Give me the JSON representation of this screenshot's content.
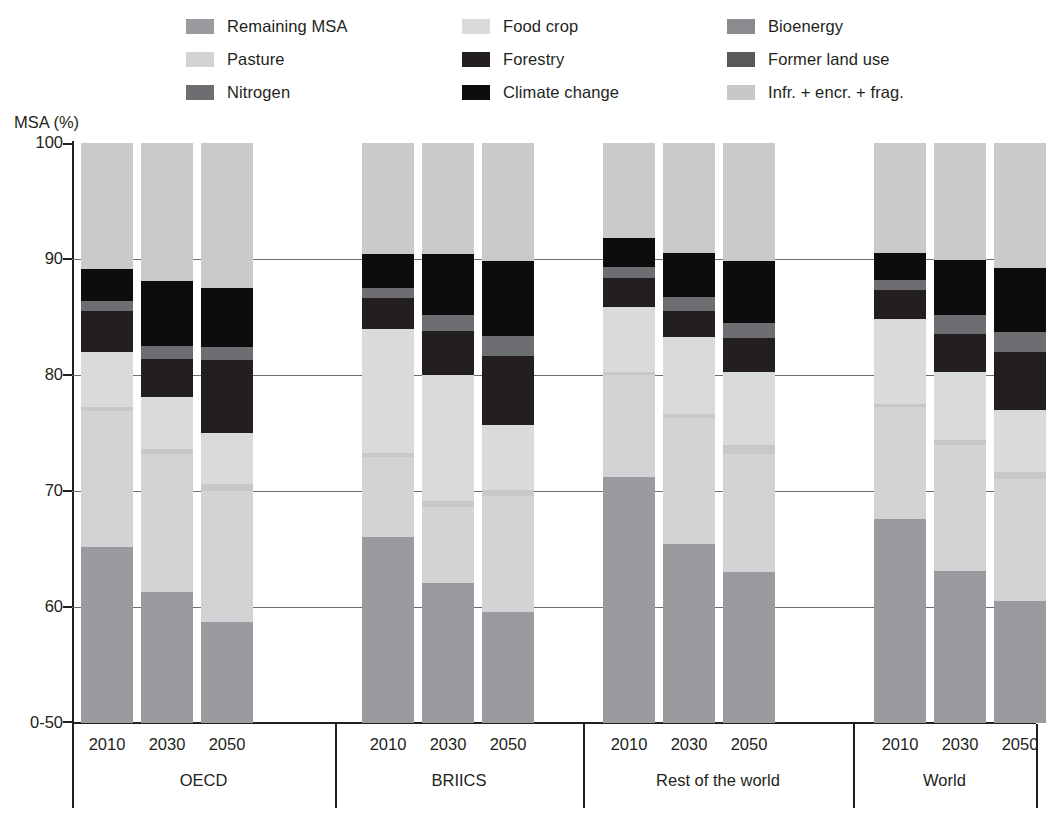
{
  "axis_title": "MSA (%)",
  "legend": {
    "columns": [
      [
        {
          "label": "Remaining MSA",
          "key": "remaining_msa",
          "color": "#9a9b9e"
        },
        {
          "label": "Pasture",
          "key": "pasture",
          "color": "#d2d3d4"
        },
        {
          "label": "Nitrogen",
          "key": "nitrogen",
          "color": "#6d6e71"
        }
      ],
      [
        {
          "label": "Food crop",
          "key": "food_crop",
          "color": "#d9dadb"
        },
        {
          "label": "Forestry",
          "key": "forestry",
          "color": "#231f20"
        },
        {
          "label": "Climate change",
          "key": "climate_change",
          "color": "#0d0d0d"
        }
      ],
      [
        {
          "label": "Bioenergy",
          "key": "bioenergy",
          "color": "#8b8c8f"
        },
        {
          "label": "Former land use",
          "key": "former_land_use",
          "color": "#58595b"
        },
        {
          "label": "Infr. + encr. + frag.",
          "key": "infr_encr_frag",
          "color": "#c7c8c9"
        }
      ]
    ]
  },
  "chart_data": {
    "type": "bar",
    "title": "",
    "xlabel": "",
    "ylabel": "MSA (%)",
    "stacked": true,
    "ylim": [
      50,
      100
    ],
    "ytick_labels": [
      "0-50",
      "60",
      "70",
      "80",
      "90",
      "100"
    ],
    "ytick_values": [
      50,
      60,
      70,
      80,
      90,
      100
    ],
    "grid": true,
    "legend_position": "top",
    "series_order": [
      "remaining_msa",
      "pasture",
      "infr_encr_frag",
      "food_crop",
      "bioenergy",
      "former_land_use",
      "forestry",
      "nitrogen",
      "climate_change"
    ],
    "groups": [
      {
        "name": "OECD",
        "years": [
          "2010",
          "2030",
          "2050"
        ],
        "bars": [
          {
            "year": "2010",
            "boundaries": [
              50.0,
              65.2,
              76.9,
              77.2,
              82.0,
              84.3,
              85.5,
              89.1,
              100.0
            ],
            "segments": [
              {
                "key": "remaining_msa",
                "from": 50.0,
                "to": 65.2
              },
              {
                "key": "pasture",
                "from": 65.2,
                "to": 76.9
              },
              {
                "key": "infr_encr_frag",
                "from": 76.9,
                "to": 77.2
              },
              {
                "key": "food_crop",
                "from": 77.2,
                "to": 82.0
              },
              {
                "key": "forestry",
                "from": 82.0,
                "to": 85.5
              },
              {
                "key": "nitrogen",
                "from": 85.5,
                "to": 86.4
              },
              {
                "key": "climate_change",
                "from": 86.4,
                "to": 89.1
              },
              {
                "key": "pasture_top",
                "from": 89.1,
                "to": 100.0
              }
            ]
          },
          {
            "year": "2030",
            "boundaries": [
              50.0,
              61.3,
              73.2,
              73.6,
              78.1,
              81.4,
              82.5,
              88.1,
              100.0
            ],
            "segments": [
              {
                "key": "remaining_msa",
                "from": 50.0,
                "to": 61.3
              },
              {
                "key": "pasture",
                "from": 61.3,
                "to": 73.2
              },
              {
                "key": "infr_encr_frag",
                "from": 73.2,
                "to": 73.6
              },
              {
                "key": "food_crop",
                "from": 73.6,
                "to": 78.1
              },
              {
                "key": "forestry",
                "from": 78.1,
                "to": 81.4
              },
              {
                "key": "nitrogen",
                "from": 81.4,
                "to": 82.5
              },
              {
                "key": "climate_change",
                "from": 82.5,
                "to": 88.1
              },
              {
                "key": "pasture_top",
                "from": 88.1,
                "to": 100.0
              }
            ]
          },
          {
            "year": "2050",
            "boundaries": [
              50.0,
              58.7,
              70.0,
              70.6,
              75.0,
              81.3,
              82.4,
              87.5,
              100.0
            ],
            "segments": [
              {
                "key": "remaining_msa",
                "from": 50.0,
                "to": 58.7
              },
              {
                "key": "pasture",
                "from": 58.7,
                "to": 70.0
              },
              {
                "key": "infr_encr_frag",
                "from": 70.0,
                "to": 70.6
              },
              {
                "key": "food_crop",
                "from": 70.6,
                "to": 75.0
              },
              {
                "key": "forestry",
                "from": 75.0,
                "to": 81.3
              },
              {
                "key": "nitrogen",
                "from": 81.3,
                "to": 82.4
              },
              {
                "key": "climate_change",
                "from": 82.4,
                "to": 87.5
              },
              {
                "key": "pasture_top",
                "from": 87.5,
                "to": 100.0
              }
            ]
          }
        ]
      },
      {
        "name": "BRIICS",
        "years": [
          "2010",
          "2030",
          "2050"
        ],
        "bars": [
          {
            "year": "2010",
            "boundaries": [
              50.0,
              66.0,
              72.9,
              73.3,
              84.0,
              86.6,
              87.5,
              90.4,
              100.0
            ],
            "segments": [
              {
                "key": "remaining_msa",
                "from": 50.0,
                "to": 66.0
              },
              {
                "key": "pasture",
                "from": 66.0,
                "to": 72.9
              },
              {
                "key": "infr_encr_frag",
                "from": 72.9,
                "to": 73.3
              },
              {
                "key": "food_crop",
                "from": 73.3,
                "to": 84.0
              },
              {
                "key": "forestry",
                "from": 84.0,
                "to": 86.6
              },
              {
                "key": "nitrogen",
                "from": 86.6,
                "to": 87.5
              },
              {
                "key": "climate_change",
                "from": 87.5,
                "to": 90.4
              },
              {
                "key": "pasture_top",
                "from": 90.4,
                "to": 100.0
              }
            ]
          },
          {
            "year": "2030",
            "boundaries": [
              50.0,
              62.1,
              68.6,
              69.1,
              80.0,
              83.8,
              85.2,
              90.4,
              100.0
            ],
            "segments": [
              {
                "key": "remaining_msa",
                "from": 50.0,
                "to": 62.1
              },
              {
                "key": "pasture",
                "from": 62.1,
                "to": 68.6
              },
              {
                "key": "infr_encr_frag",
                "from": 68.6,
                "to": 69.1
              },
              {
                "key": "food_crop",
                "from": 69.1,
                "to": 80.0
              },
              {
                "key": "forestry",
                "from": 80.0,
                "to": 83.8
              },
              {
                "key": "nitrogen",
                "from": 83.8,
                "to": 85.2
              },
              {
                "key": "climate_change",
                "from": 85.2,
                "to": 90.4
              },
              {
                "key": "pasture_top",
                "from": 90.4,
                "to": 100.0
              }
            ]
          },
          {
            "year": "2050",
            "boundaries": [
              50.0,
              59.6,
              69.6,
              70.1,
              75.7,
              81.6,
              83.4,
              89.8,
              100.0
            ],
            "segments": [
              {
                "key": "remaining_msa",
                "from": 50.0,
                "to": 59.6
              },
              {
                "key": "pasture",
                "from": 59.6,
                "to": 69.6
              },
              {
                "key": "infr_encr_frag",
                "from": 69.6,
                "to": 70.1
              },
              {
                "key": "food_crop",
                "from": 70.1,
                "to": 75.7
              },
              {
                "key": "forestry",
                "from": 75.7,
                "to": 81.6
              },
              {
                "key": "nitrogen",
                "from": 81.6,
                "to": 83.4
              },
              {
                "key": "climate_change",
                "from": 83.4,
                "to": 89.8
              },
              {
                "key": "pasture_top",
                "from": 89.8,
                "to": 100.0
              }
            ]
          }
        ]
      },
      {
        "name": "Rest of the world",
        "years": [
          "2010",
          "2030",
          "2050"
        ],
        "bars": [
          {
            "year": "2010",
            "boundaries": [
              50.0,
              71.2,
              80.0,
              80.3,
              85.9,
              88.4,
              89.3,
              91.8,
              100.0
            ],
            "segments": [
              {
                "key": "remaining_msa",
                "from": 50.0,
                "to": 71.2
              },
              {
                "key": "pasture",
                "from": 71.2,
                "to": 80.0
              },
              {
                "key": "infr_encr_frag",
                "from": 80.0,
                "to": 80.3
              },
              {
                "key": "food_crop",
                "from": 80.3,
                "to": 85.9
              },
              {
                "key": "forestry",
                "from": 85.9,
                "to": 88.4
              },
              {
                "key": "nitrogen",
                "from": 88.4,
                "to": 89.3
              },
              {
                "key": "climate_change",
                "from": 89.3,
                "to": 91.8
              },
              {
                "key": "pasture_top",
                "from": 91.8,
                "to": 100.0
              }
            ]
          },
          {
            "year": "2030",
            "boundaries": [
              50.0,
              65.4,
              76.3,
              76.6,
              83.3,
              85.5,
              86.7,
              90.5,
              100.0
            ],
            "segments": [
              {
                "key": "remaining_msa",
                "from": 50.0,
                "to": 65.4
              },
              {
                "key": "pasture",
                "from": 65.4,
                "to": 76.3
              },
              {
                "key": "infr_encr_frag",
                "from": 76.3,
                "to": 76.6
              },
              {
                "key": "food_crop",
                "from": 76.6,
                "to": 83.3
              },
              {
                "key": "forestry",
                "from": 83.3,
                "to": 85.5
              },
              {
                "key": "nitrogen",
                "from": 85.5,
                "to": 86.7
              },
              {
                "key": "climate_change",
                "from": 86.7,
                "to": 90.5
              },
              {
                "key": "pasture_top",
                "from": 90.5,
                "to": 100.0
              }
            ]
          },
          {
            "year": "2050",
            "boundaries": [
              50.0,
              63.0,
              73.2,
              74.0,
              80.3,
              83.2,
              84.5,
              89.8,
              100.0
            ],
            "segments": [
              {
                "key": "remaining_msa",
                "from": 50.0,
                "to": 63.0
              },
              {
                "key": "pasture",
                "from": 63.0,
                "to": 73.2
              },
              {
                "key": "infr_encr_frag",
                "from": 73.2,
                "to": 74.0
              },
              {
                "key": "food_crop",
                "from": 74.0,
                "to": 80.3
              },
              {
                "key": "forestry",
                "from": 80.3,
                "to": 83.2
              },
              {
                "key": "nitrogen",
                "from": 83.2,
                "to": 84.5
              },
              {
                "key": "climate_change",
                "from": 84.5,
                "to": 89.8
              },
              {
                "key": "pasture_top",
                "from": 89.8,
                "to": 100.0
              }
            ]
          }
        ]
      },
      {
        "name": "World",
        "years": [
          "2010",
          "2030",
          "2050"
        ],
        "bars": [
          {
            "year": "2010",
            "boundaries": [
              50.0,
              67.6,
              77.2,
              77.5,
              84.8,
              87.3,
              88.2,
              90.5,
              100.0
            ],
            "segments": [
              {
                "key": "remaining_msa",
                "from": 50.0,
                "to": 67.6
              },
              {
                "key": "pasture",
                "from": 67.6,
                "to": 77.2
              },
              {
                "key": "infr_encr_frag",
                "from": 77.2,
                "to": 77.5
              },
              {
                "key": "food_crop",
                "from": 77.5,
                "to": 84.8
              },
              {
                "key": "forestry",
                "from": 84.8,
                "to": 87.3
              },
              {
                "key": "nitrogen",
                "from": 87.3,
                "to": 88.2
              },
              {
                "key": "climate_change",
                "from": 88.2,
                "to": 90.5
              },
              {
                "key": "pasture_top",
                "from": 90.5,
                "to": 100.0
              }
            ]
          },
          {
            "year": "2030",
            "boundaries": [
              50.0,
              63.1,
              74.0,
              74.4,
              80.3,
              83.5,
              85.2,
              89.9,
              100.0
            ],
            "segments": [
              {
                "key": "remaining_msa",
                "from": 50.0,
                "to": 63.1
              },
              {
                "key": "pasture",
                "from": 63.1,
                "to": 74.0
              },
              {
                "key": "infr_encr_frag",
                "from": 74.0,
                "to": 74.4
              },
              {
                "key": "food_crop",
                "from": 74.4,
                "to": 80.3
              },
              {
                "key": "forestry",
                "from": 80.3,
                "to": 83.5
              },
              {
                "key": "nitrogen",
                "from": 83.5,
                "to": 85.2
              },
              {
                "key": "climate_change",
                "from": 85.2,
                "to": 89.9
              },
              {
                "key": "pasture_top",
                "from": 89.9,
                "to": 100.0
              }
            ]
          },
          {
            "year": "2050",
            "boundaries": [
              50.0,
              60.5,
              71.0,
              71.6,
              77.0,
              82.0,
              83.7,
              89.2,
              100.0
            ],
            "segments": [
              {
                "key": "remaining_msa",
                "from": 50.0,
                "to": 60.5
              },
              {
                "key": "pasture",
                "from": 60.5,
                "to": 71.0
              },
              {
                "key": "infr_encr_frag",
                "from": 71.0,
                "to": 71.6
              },
              {
                "key": "food_crop",
                "from": 71.6,
                "to": 77.0
              },
              {
                "key": "forestry",
                "from": 77.0,
                "to": 82.0
              },
              {
                "key": "nitrogen",
                "from": 82.0,
                "to": 83.7
              },
              {
                "key": "climate_change",
                "from": 83.7,
                "to": 89.2
              },
              {
                "key": "pasture_top",
                "from": 89.2,
                "to": 100.0
              }
            ]
          }
        ]
      }
    ]
  },
  "colors": {
    "remaining_msa": "#9a9b9e",
    "pasture": "#d2d3d4",
    "pasture_top": "#c9cacb",
    "nitrogen": "#6d6e71",
    "food_crop": "#d9dadb",
    "forestry": "#231f20",
    "climate_change": "#0d0d0d",
    "bioenergy": "#8b8c8f",
    "former_land_use": "#58595b",
    "infr_encr_frag": "#c7c8c9",
    "axis": "#231f20",
    "grid": "#6d6e71"
  }
}
